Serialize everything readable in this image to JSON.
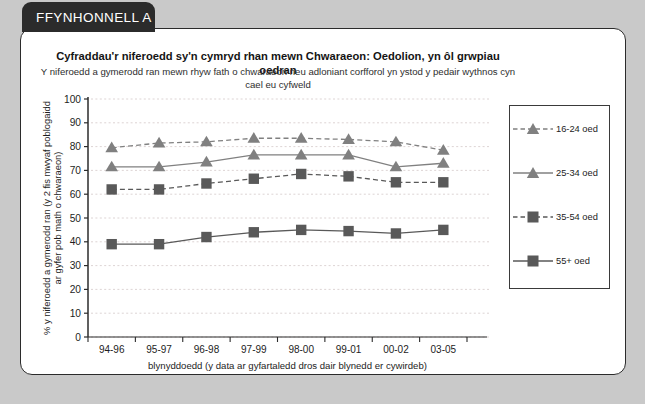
{
  "source_tab": {
    "label": "FFYNHONNELL A"
  },
  "chart_data": {
    "type": "line",
    "title": "Cyfraddau'r niferoedd sy'n cymryd rhan mewn Chwaraeon: Oedolion, yn ôl grwpiau oedran",
    "subtitle": "Y niferoedd a gymerodd ran mewn rhyw fath o chwaraeon neu adloniant corfforol yn ystod y pedair wythnos cyn cael eu cyfweld",
    "xlabel": "blynyddoedd (y data ar gyfartaledd dros dair blynedd er cywirdeb)",
    "ylabel": "% y niferoedd a gymerodd ran (y 2 fis mwyaf poblogaidd ar gyfer pob math o chwaraeon)",
    "categories": [
      "94-96",
      "95-97",
      "96-98",
      "97-99",
      "98-00",
      "99-01",
      "00-02",
      "03-05"
    ],
    "ylim": [
      0,
      100
    ],
    "ytick_step": 10,
    "yticks": [
      "0",
      "10",
      "20",
      "30",
      "40",
      "50",
      "60",
      "70",
      "80",
      "90",
      "100"
    ],
    "grid": true,
    "legend_position": "right",
    "series": [
      {
        "name": "16-24 oed",
        "values": [
          79.5,
          81.5,
          82,
          83.5,
          83.5,
          83,
          82,
          78.5
        ],
        "marker": "triangle",
        "line": "dashed",
        "color": "#808080"
      },
      {
        "name": "25-34 oed",
        "values": [
          71.5,
          71.5,
          73.5,
          76.5,
          76.5,
          76.5,
          71.5,
          73
        ],
        "marker": "triangle",
        "line": "solid",
        "color": "#808080"
      },
      {
        "name": "35-54 oed",
        "values": [
          62,
          62,
          64.5,
          66.5,
          68.5,
          67.5,
          65,
          65
        ],
        "marker": "square",
        "line": "dashed",
        "color": "#595959"
      },
      {
        "name": "55+ oed",
        "values": [
          39,
          39,
          42,
          44,
          45,
          44.5,
          43.5,
          45
        ],
        "marker": "square",
        "line": "solid",
        "color": "#595959"
      }
    ]
  },
  "colors": {
    "page_background": "#c9c9c9",
    "panel_background": "#ffffff",
    "panel_border": "#2b2b2b",
    "tab_background": "#2b2b2b",
    "tab_text": "#ffffff",
    "axis": "#2b2b2b",
    "grid": "#d9cfcf",
    "triangle_series": "#808080",
    "square_series": "#595959"
  }
}
